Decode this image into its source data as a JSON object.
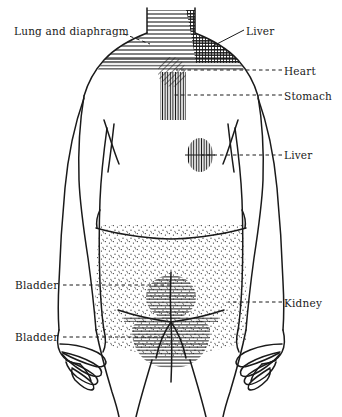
{
  "figure": {
    "background_color": "#ffffff",
    "ink_color": "#1a1a1a",
    "view": "anterior full-body line drawing, head cropped at neck"
  },
  "labels": [
    {
      "id": "lung",
      "text": "Lung and diaphragm",
      "side": "left",
      "leader": "dashed"
    },
    {
      "id": "liver_top",
      "text": "Liver",
      "side": "right",
      "leader": "dashed"
    },
    {
      "id": "heart",
      "text": "Heart",
      "side": "right",
      "leader": "dashed"
    },
    {
      "id": "stomach",
      "text": "Stomach",
      "side": "right",
      "leader": "dashed"
    },
    {
      "id": "liver_mid",
      "text": "Liver",
      "side": "right",
      "leader": "dashed"
    },
    {
      "id": "kidney",
      "text": "Kidney",
      "side": "right",
      "leader": "dashed"
    },
    {
      "id": "bladder1",
      "text": "Bladder",
      "side": "left",
      "leader": "dashed"
    },
    {
      "id": "bladder2",
      "text": "Bladder",
      "side": "left",
      "leader": "dashed"
    }
  ],
  "regions": [
    {
      "id": "lung_diaphragm",
      "label": "Lung and diaphragm",
      "fill": "horizontal-hatch",
      "location": "both shoulders and upper chest band"
    },
    {
      "id": "liver_shoulder",
      "label": "Liver",
      "fill": "cross-hatch",
      "location": "right shoulder wedge"
    },
    {
      "id": "heart",
      "label": "Heart",
      "fill": "diagonal-hatch",
      "location": "upper central chest oval"
    },
    {
      "id": "stomach",
      "label": "Stomach",
      "fill": "vertical-hatch",
      "location": "central chest column below heart"
    },
    {
      "id": "liver_flank",
      "label": "Liver",
      "fill": "vertical-hatch",
      "location": "right mid-torso oval"
    },
    {
      "id": "abdomen_stipple",
      "label": "",
      "fill": "stipple",
      "location": "lower abdomen and pelvis"
    },
    {
      "id": "bladder_upper",
      "label": "Bladder",
      "fill": "horizontal-hatch",
      "location": "central lower abdomen circle"
    },
    {
      "id": "bladder_lower",
      "label": "Bladder",
      "fill": "horizontal-hatch",
      "location": "pelvic/groin region"
    }
  ]
}
